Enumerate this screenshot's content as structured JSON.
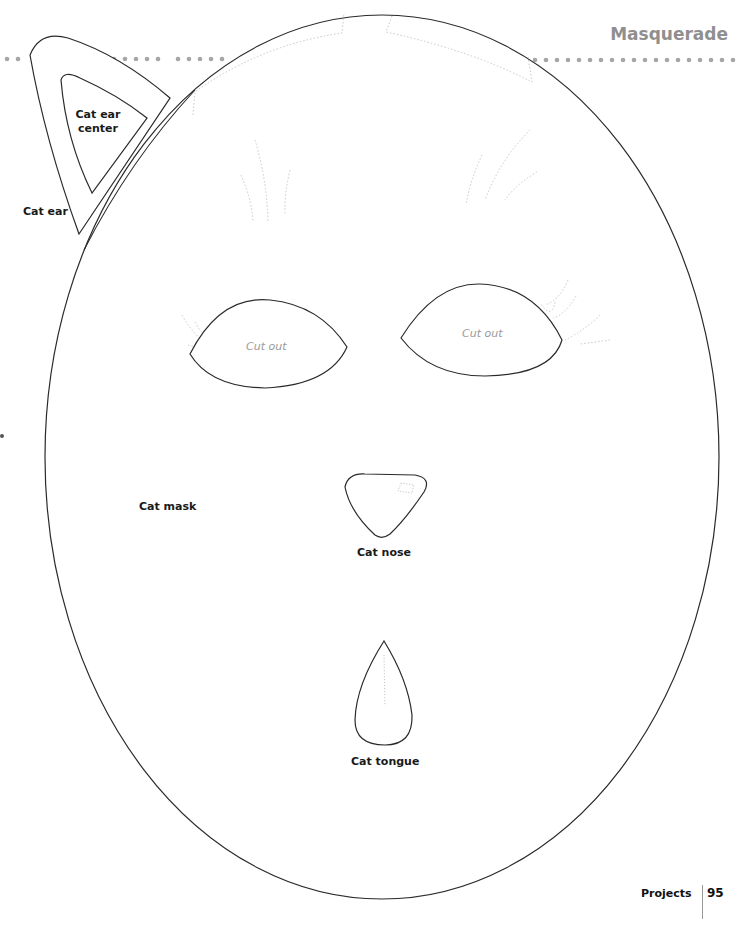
{
  "header": {
    "title": "Masquerade",
    "dotted_rule_color": "#a6a6a6"
  },
  "template": {
    "ear": {
      "label": "Cat ear"
    },
    "ear_center": {
      "label_line1": "Cat ear",
      "label_line2": "center"
    },
    "mask": {
      "label": "Cat mask"
    },
    "left_eye": {
      "label": "Cut out"
    },
    "right_eye": {
      "label": "Cut out"
    },
    "nose": {
      "label": "Cat nose"
    },
    "tongue": {
      "label": "Cat tongue"
    }
  },
  "footer": {
    "section": "Projects",
    "page_number": "95"
  },
  "colors": {
    "outline": "#2a2a2a",
    "fold_line": "#c8c8c8",
    "cutout_text": "#9a9a9a",
    "header_text": "#8f8f8f"
  }
}
